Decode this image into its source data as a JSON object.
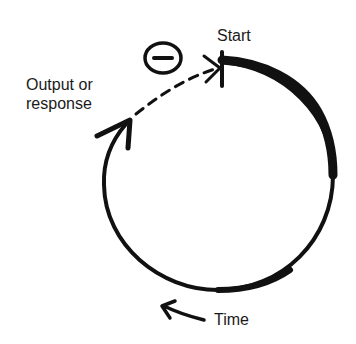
{
  "diagram": {
    "labels": {
      "start": "Start",
      "output_line1": "Output or",
      "output_line2": "response",
      "time": "Time"
    },
    "feedback_sign": "−",
    "colors": {
      "ink": "#111111",
      "background": "#ffffff"
    }
  }
}
